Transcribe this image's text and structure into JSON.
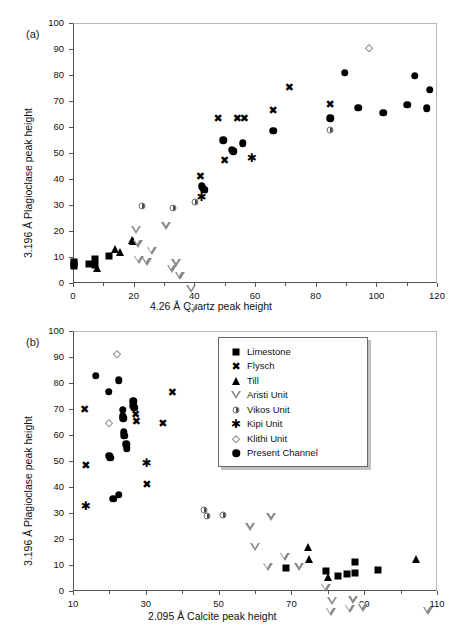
{
  "figure": {
    "panels": [
      {
        "tag": "(a)",
        "xlabel": "4.26  Å Quartz peak height",
        "ylabel": "3.196 Å Plagioclase peak height"
      },
      {
        "tag": "(b)",
        "xlabel": "2.095 Å Calcite peak height",
        "ylabel": "3.196 Å Plagioclase peak height"
      }
    ]
  },
  "legend": {
    "position": "inside-top-right-panel-b",
    "entries": [
      {
        "label": "Limestone",
        "marker": "filled-square",
        "color": "#000000"
      },
      {
        "label": "Flysch",
        "marker": "bold-x",
        "color": "#000000"
      },
      {
        "label": "Till",
        "marker": "filled-triangle-up",
        "color": "#000000"
      },
      {
        "label": "Aristi Unit",
        "marker": "open-triangle-down",
        "color": "#8a8a8a"
      },
      {
        "label": "Vikos Unit",
        "marker": "half-filled-circle",
        "color": "#4d4d4d"
      },
      {
        "label": "Kipi Unit",
        "marker": "asterisk",
        "color": "#000000"
      },
      {
        "label": "Klithi Unit",
        "marker": "open-diamond",
        "color": "#8d8d8d"
      },
      {
        "label": "Present Channel",
        "marker": "filled-circle",
        "color": "#000000"
      }
    ]
  },
  "chart_data": [
    {
      "type": "scatter",
      "panel": "a",
      "title": "(a)",
      "xlabel": "4.26  Å Quartz peak height",
      "ylabel": "3.196 Å Plagioclase peak height",
      "xlim": [
        0,
        120
      ],
      "ylim": [
        0,
        100
      ],
      "xticks": [
        0,
        20,
        40,
        60,
        80,
        100,
        120
      ],
      "xminor": [
        10,
        30,
        50,
        70,
        90,
        110
      ],
      "yticks": [
        0,
        10,
        20,
        30,
        40,
        50,
        60,
        70,
        80,
        90,
        100
      ],
      "grid": false,
      "series": [
        {
          "name": "Limestone",
          "marker": "filled-square",
          "points": [
            [
              0.2,
              8.2
            ],
            [
              0.2,
              6.4
            ],
            [
              5.3,
              7.3
            ],
            [
              7.4,
              9.2
            ],
            [
              7.2,
              7.0
            ],
            [
              12.0,
              10.3
            ],
            [
              0.3,
              7.3
            ]
          ]
        },
        {
          "name": "Flysch",
          "marker": "bold-x",
          "points": [
            [
              42.0,
              41.0
            ],
            [
              43.2,
              35.7
            ],
            [
              47.8,
              63.4
            ],
            [
              54.2,
              63.3
            ],
            [
              56.5,
              63.4
            ],
            [
              50.0,
              47.3
            ],
            [
              66.0,
              66.4
            ],
            [
              71.3,
              75.3
            ],
            [
              84.8,
              68.7
            ]
          ]
        },
        {
          "name": "Till",
          "marker": "filled-triangle-up",
          "points": [
            [
              8.0,
              5.6
            ],
            [
              13.8,
              13.2
            ],
            [
              15.6,
              11.8
            ],
            [
              19.6,
              16.6
            ],
            [
              19.8,
              16.0
            ]
          ]
        },
        {
          "name": "Aristi Unit",
          "marker": "open-triangle-down",
          "points": [
            [
              20.8,
              20.2
            ],
            [
              21.3,
              18.1
            ],
            [
              21.6,
              15.0
            ],
            [
              24.3,
              17.5
            ],
            [
              26.0,
              24.6
            ],
            [
              30.8,
              37.5
            ],
            [
              32.6,
              23.9
            ],
            [
              34.0,
              29.4
            ],
            [
              35.2,
              27.4
            ],
            [
              39.0,
              25.3
            ],
            [
              39.4,
              20.6
            ]
          ]
        },
        {
          "name": "Vikos Unit",
          "marker": "half-filled-circle",
          "points": [
            [
              22.7,
              29.6
            ],
            [
              33.0,
              28.8
            ],
            [
              40.2,
              31.2
            ],
            [
              84.8,
              58.8
            ]
          ]
        },
        {
          "name": "Kipi Unit",
          "marker": "asterisk",
          "points": [
            [
              42.4,
              33.2
            ],
            [
              58.9,
              48.2
            ]
          ]
        },
        {
          "name": "Klithi Unit",
          "marker": "open-diamond",
          "points": [
            [
              97.6,
              90.2
            ]
          ]
        },
        {
          "name": "Present Channel",
          "marker": "filled-circle",
          "points": [
            [
              42.4,
              37.3
            ],
            [
              42.8,
              36.6
            ],
            [
              43.2,
              35.8
            ],
            [
              49.6,
              55.0
            ],
            [
              52.3,
              51.3
            ],
            [
              52.9,
              50.6
            ],
            [
              56.0,
              53.8
            ],
            [
              66.0,
              58.5
            ],
            [
              84.8,
              63.3
            ],
            [
              89.6,
              80.9
            ],
            [
              94.0,
              67.4
            ],
            [
              102.2,
              65.4
            ],
            [
              110.2,
              68.6
            ],
            [
              112.6,
              79.8
            ],
            [
              116.6,
              67.2
            ],
            [
              117.6,
              74.4
            ]
          ]
        }
      ]
    },
    {
      "type": "scatter",
      "panel": "b",
      "title": "(b)",
      "xlabel": "2.095 Å Calcite peak height",
      "ylabel": "3.196 Å Plagioclase peak height",
      "xlim": [
        10,
        110
      ],
      "ylim": [
        0,
        100
      ],
      "xticks": [
        10,
        30,
        50,
        70,
        90,
        110
      ],
      "xminor": [
        20,
        40,
        60,
        80,
        100
      ],
      "yticks": [
        0,
        10,
        20,
        30,
        40,
        50,
        60,
        70,
        80,
        90,
        100
      ],
      "grid": false,
      "series": [
        {
          "name": "Limestone",
          "marker": "filled-square",
          "points": [
            [
              68.5,
              8.8
            ],
            [
              79.6,
              7.8
            ],
            [
              82.8,
              5.9
            ],
            [
              85.3,
              6.5
            ],
            [
              87.4,
              11.0
            ],
            [
              87.5,
              7.1
            ],
            [
              93.8,
              8.0
            ]
          ]
        },
        {
          "name": "Flysch",
          "marker": "bold-x",
          "points": [
            [
              13.2,
              70.0
            ],
            [
              13.5,
              48.6
            ],
            [
              27.2,
              68.1
            ],
            [
              27.4,
              65.2
            ],
            [
              30.3,
              41.3
            ],
            [
              34.7,
              64.7
            ],
            [
              37.3,
              76.6
            ]
          ]
        },
        {
          "name": "Till",
          "marker": "filled-triangle-up",
          "points": [
            [
              74.6,
              17.0
            ],
            [
              74.8,
              12.4
            ],
            [
              80.0,
              5.2
            ],
            [
              104.2,
              12.5
            ]
          ]
        },
        {
          "name": "Aristi Unit",
          "marker": "open-triangle-down",
          "points": [
            [
              58.6,
              24.8
            ],
            [
              60.0,
              20.0
            ],
            [
              63.5,
              15.3
            ],
            [
              64.5,
              37.7
            ],
            [
              68.2,
              25.3
            ],
            [
              72.2,
              24.7
            ],
            [
              79.4,
              19.5
            ],
            [
              81.2,
              17.6
            ],
            [
              80.8,
              16.5
            ],
            [
              86.0,
              20.6
            ],
            [
              87.0,
              27.5
            ],
            [
              89.6,
              27.5
            ],
            [
              107.4,
              29.3
            ]
          ]
        },
        {
          "name": "Vikos Unit",
          "marker": "half-filled-circle",
          "points": [
            [
              46.0,
              31.2
            ],
            [
              46.7,
              29.0
            ],
            [
              51.2,
              29.4
            ]
          ]
        },
        {
          "name": "Kipi Unit",
          "marker": "asterisk",
          "points": [
            [
              13.5,
              32.8
            ],
            [
              30.2,
              49.2
            ]
          ]
        },
        {
          "name": "Klithi Unit",
          "marker": "open-diamond",
          "points": [
            [
              22.2,
              91.0
            ],
            [
              19.8,
              64.8
            ]
          ]
        },
        {
          "name": "Present Channel",
          "marker": "filled-circle",
          "points": [
            [
              16.3,
              82.8
            ],
            [
              19.8,
              76.7
            ],
            [
              22.5,
              81.1
            ],
            [
              20.0,
              52.0
            ],
            [
              20.3,
              51.3
            ],
            [
              21.0,
              35.4
            ],
            [
              22.5,
              37.0
            ],
            [
              23.6,
              69.8
            ],
            [
              23.7,
              67.3
            ],
            [
              23.8,
              66.5
            ],
            [
              24.0,
              61.0
            ],
            [
              24.1,
              59.8
            ],
            [
              24.6,
              56.5
            ],
            [
              24.8,
              55.0
            ],
            [
              26.5,
              72.9
            ],
            [
              26.6,
              71.2
            ],
            [
              26.8,
              70.4
            ]
          ]
        }
      ]
    }
  ]
}
